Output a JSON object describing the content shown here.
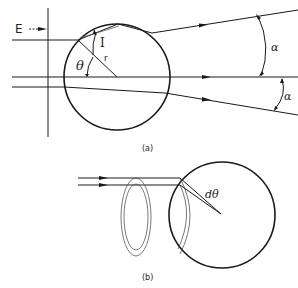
{
  "figure": {
    "panel_a": {
      "caption": "(a)",
      "labels": {
        "field": "E",
        "incidence_angle": "I",
        "polar_angle": "θ",
        "radius": "r",
        "deflection_upper": "α",
        "deflection_lower": "α"
      }
    },
    "panel_b": {
      "caption": "(b)",
      "labels": {
        "angle_increment": "dθ"
      }
    }
  }
}
